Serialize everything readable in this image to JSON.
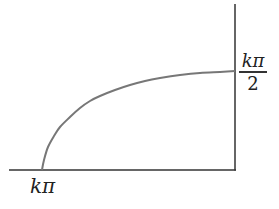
{
  "diagram": {
    "x_axis_label": "kπ",
    "y_axis_label": {
      "numerator": "kπ",
      "denominator": "2"
    },
    "colors": {
      "axes": "#333333",
      "curve": "#777777",
      "background": "#ffffff"
    },
    "curve_points": [
      [
        42,
        170
      ],
      [
        44,
        160
      ],
      [
        48,
        147
      ],
      [
        54,
        136
      ],
      [
        60,
        127
      ],
      [
        70,
        117
      ],
      [
        80,
        108
      ],
      [
        90,
        101
      ],
      [
        100,
        96
      ],
      [
        115,
        90
      ],
      [
        130,
        85
      ],
      [
        145,
        81
      ],
      [
        160,
        78
      ],
      [
        180,
        75
      ],
      [
        200,
        73
      ],
      [
        220,
        72
      ],
      [
        235,
        71
      ]
    ]
  }
}
